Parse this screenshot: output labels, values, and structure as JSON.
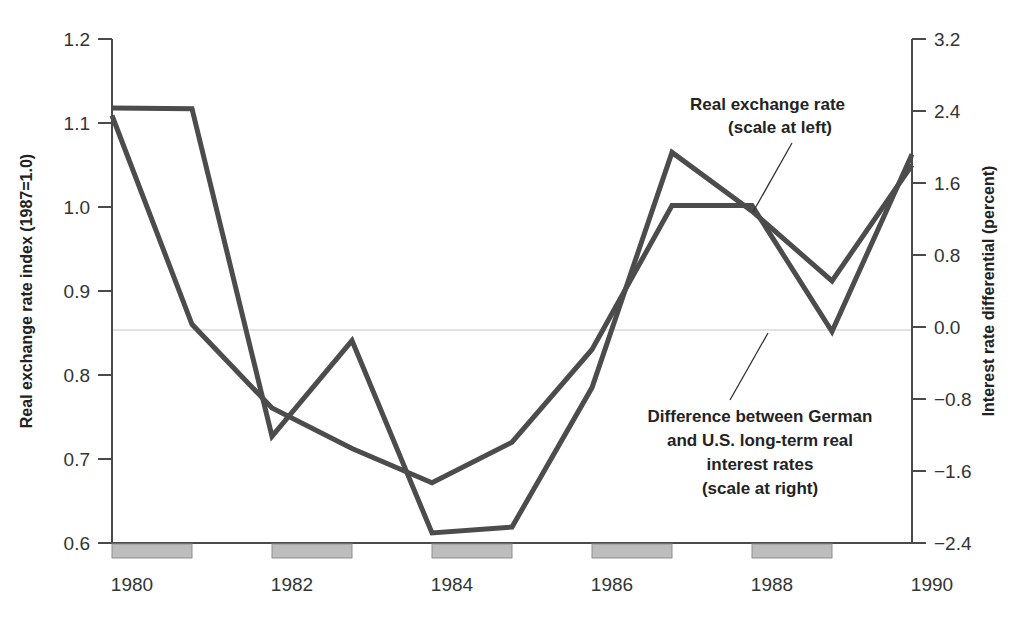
{
  "chart_data": {
    "type": "line",
    "title": "",
    "xlabel": "",
    "x": [
      1980,
      1981,
      1982,
      1983,
      1984,
      1985,
      1986,
      1987,
      1988,
      1989,
      1990
    ],
    "xtick_labels": [
      "1980",
      "1982",
      "1984",
      "1986",
      "1988",
      "1990"
    ],
    "xtick_values": [
      1980,
      1982,
      1984,
      1986,
      1988,
      1990
    ],
    "xlim": [
      1980,
      1990
    ],
    "grid": false,
    "legend_position": "annotations-inline",
    "left_axis": {
      "label": "Real exchange rate index (1987=1.0)",
      "ylim": [
        0.6,
        1.2
      ],
      "ticks": [
        0.6,
        0.7,
        0.8,
        0.9,
        1.0,
        1.1,
        1.2
      ],
      "tick_labels": [
        "0.6",
        "0.7",
        "0.8",
        "0.9",
        "1.0",
        "1.1",
        "1.2"
      ]
    },
    "right_axis": {
      "label": "Interest rate differential (percent)",
      "ylim": [
        -2.4,
        3.2
      ],
      "ticks": [
        -2.4,
        -1.6,
        -0.8,
        0.0,
        0.8,
        1.6,
        2.4,
        3.2
      ],
      "tick_labels": [
        "−2.4",
        "−1.6",
        "−0.8",
        "0.0",
        "0.8",
        "1.6",
        "2.4",
        "3.2"
      ]
    },
    "zero_reference_line": 0.0,
    "series": [
      {
        "name": "Real exchange rate",
        "axis": "left",
        "values": [
          1.118,
          1.117,
          0.727,
          0.841,
          0.612,
          0.619,
          0.785,
          1.065,
          0.995,
          0.912,
          1.05
        ]
      },
      {
        "name": "Difference between German and U.S. long-term real interest rates",
        "axis": "right",
        "values": [
          2.35,
          0.03,
          -0.9,
          -1.35,
          -1.73,
          -1.28,
          -0.25,
          1.35,
          1.35,
          -0.05,
          1.92
        ]
      }
    ],
    "annotations": [
      {
        "id": "real-exchange-rate-annotation",
        "lines": [
          "Real exchange rate",
          "(scale at left)"
        ],
        "text": "Real exchange rate (scale at left)"
      },
      {
        "id": "interest-differential-annotation",
        "lines": [
          "Difference between German",
          "and U.S. long-term real",
          "interest rates",
          "(scale at right)"
        ],
        "text": "Difference between German and U.S. long-term real interest rates (scale at right)"
      }
    ],
    "colors": {
      "line": "#4c4c4c",
      "axis": "#4a4a4a",
      "zero_grid": "#d8d8d8",
      "year_block": "#bdbdbd",
      "background": "#ffffff",
      "text": "#232323"
    }
  }
}
